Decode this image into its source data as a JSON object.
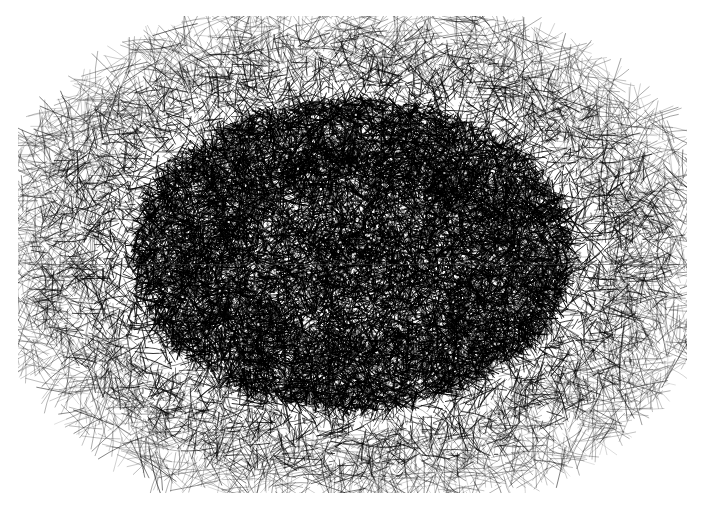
{
  "artwork": {
    "title": "Dense Scribble Field",
    "medium": "ink-pen-strokes",
    "canvas": {
      "width": 711,
      "height": 512,
      "background_color": "#ffffff"
    },
    "region": {
      "x0": 24,
      "y0": 22,
      "x1": 681,
      "y1": 487,
      "width": 657,
      "height": 465,
      "center_x": 352.5,
      "center_y": 254.5
    },
    "ink_color": "#000000",
    "composition": "radial density gradient: saturated black core fading to sparse isolated strokes at the fringe",
    "seam": {
      "present": true,
      "orientation": "horizontal",
      "y": 264,
      "color": "#3a3a3a"
    },
    "strokes": {
      "total": 26000,
      "core_count": 15000,
      "mid_count": 7500,
      "fringe_count": 3000,
      "outlier_count": 500,
      "min_length": 3,
      "max_length": 46,
      "min_width": 0.35,
      "max_width": 1.5,
      "angle_min_deg": 0,
      "angle_max_deg": 360
    },
    "density": {
      "core_radius_fraction": 0.52,
      "falloff_exponent": 2.35,
      "edge_softness": 0.3,
      "core_opacity": 0.95,
      "fringe_opacity": 0.62,
      "speckle_count": 2600
    },
    "palette": {
      "background": "#ffffff",
      "ink": "#000000",
      "core_tone": "#050505",
      "mid_tone": "#2e2e2e",
      "fringe_tone": "#6b6b6b",
      "speckle": "#ffffff"
    }
  }
}
